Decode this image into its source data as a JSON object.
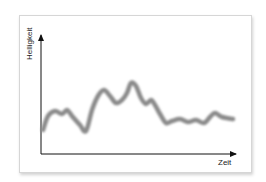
{
  "chart_data": {
    "type": "line",
    "title": "",
    "xlabel": "Zeit",
    "ylabel": "Helligkeit",
    "grid": false,
    "legend": null,
    "x_ticks": [],
    "y_ticks": [],
    "series": [
      {
        "name": "Helligkeit",
        "color": "#8a8a8a",
        "style": "thick blurred line",
        "points_px": [
          [
            43,
            130
          ],
          [
            48,
            116
          ],
          [
            55,
            111
          ],
          [
            62,
            114
          ],
          [
            67,
            110
          ],
          [
            72,
            116
          ],
          [
            80,
            125
          ],
          [
            86,
            131
          ],
          [
            92,
            110
          ],
          [
            98,
            96
          ],
          [
            104,
            90
          ],
          [
            110,
            96
          ],
          [
            116,
            103
          ],
          [
            122,
            100
          ],
          [
            127,
            93
          ],
          [
            131,
            83
          ],
          [
            136,
            86
          ],
          [
            141,
            98
          ],
          [
            146,
            104
          ],
          [
            151,
            100
          ],
          [
            155,
            105
          ],
          [
            160,
            114
          ],
          [
            166,
            123
          ],
          [
            172,
            121
          ],
          [
            180,
            119
          ],
          [
            188,
            122
          ],
          [
            196,
            120
          ],
          [
            204,
            123
          ],
          [
            210,
            117
          ],
          [
            215,
            113
          ],
          [
            222,
            117
          ],
          [
            233,
            119
          ]
        ]
      }
    ]
  },
  "labels": {
    "y_axis": "Helligkeit",
    "x_axis": "Zeit"
  },
  "colors": {
    "axis": "#111111",
    "curve": "#8a8a8a",
    "frame_border": "#d6d6d6"
  }
}
